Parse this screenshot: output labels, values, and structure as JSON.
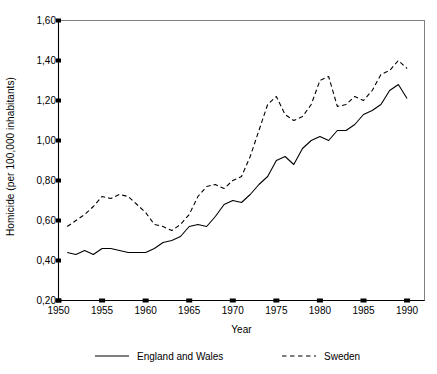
{
  "chart_data": {
    "type": "line",
    "title": "",
    "subtitle": "",
    "xlabel": "Year",
    "ylabel": "Homicide (per 100,000 inhabitants)",
    "xlim": [
      1950,
      1992
    ],
    "ylim": [
      0.2,
      1.6
    ],
    "grid": false,
    "legend_position": "bottom",
    "decimal_separator": ",",
    "xticks": [
      1950,
      1955,
      1960,
      1965,
      1970,
      1975,
      1980,
      1985,
      1990
    ],
    "xtick_labels": [
      "1950",
      "1955",
      "1960",
      "1965",
      "1970",
      "1975",
      "1980",
      "1985",
      "1990"
    ],
    "yticks": [
      0.2,
      0.4,
      0.6,
      0.8,
      1.0,
      1.2,
      1.4,
      1.6
    ],
    "ytick_labels": [
      "0,20",
      "0,40",
      "0,60",
      "0,80",
      "1,00",
      "1,20",
      "1,40",
      "1,60"
    ],
    "series": [
      {
        "name": "England and Wales",
        "style": "solid",
        "color": "#000000",
        "x": [
          1951,
          1952,
          1953,
          1954,
          1955,
          1956,
          1957,
          1958,
          1959,
          1960,
          1961,
          1962,
          1963,
          1964,
          1965,
          1966,
          1967,
          1968,
          1969,
          1970,
          1971,
          1972,
          1973,
          1974,
          1975,
          1976,
          1977,
          1978,
          1979,
          1980,
          1981,
          1982,
          1983,
          1984,
          1985,
          1986,
          1987,
          1988,
          1989,
          1990
        ],
        "values": [
          0.44,
          0.43,
          0.45,
          0.43,
          0.46,
          0.46,
          0.45,
          0.44,
          0.44,
          0.44,
          0.46,
          0.49,
          0.5,
          0.52,
          0.57,
          0.58,
          0.57,
          0.62,
          0.68,
          0.7,
          0.69,
          0.73,
          0.78,
          0.82,
          0.9,
          0.92,
          0.88,
          0.96,
          1.0,
          1.02,
          1.0,
          1.05,
          1.05,
          1.08,
          1.13,
          1.15,
          1.18,
          1.25,
          1.28,
          1.21
        ]
      },
      {
        "name": "Sweden",
        "style": "dashed",
        "color": "#000000",
        "x": [
          1951,
          1952,
          1953,
          1954,
          1955,
          1956,
          1957,
          1958,
          1959,
          1960,
          1961,
          1962,
          1963,
          1964,
          1965,
          1966,
          1967,
          1968,
          1969,
          1970,
          1971,
          1972,
          1973,
          1974,
          1975,
          1976,
          1977,
          1978,
          1979,
          1980,
          1981,
          1982,
          1983,
          1984,
          1985,
          1986,
          1987,
          1988,
          1989,
          1990
        ],
        "values": [
          0.57,
          0.6,
          0.63,
          0.67,
          0.72,
          0.71,
          0.73,
          0.72,
          0.68,
          0.64,
          0.58,
          0.57,
          0.55,
          0.58,
          0.63,
          0.72,
          0.77,
          0.78,
          0.76,
          0.8,
          0.82,
          0.92,
          1.05,
          1.18,
          1.22,
          1.13,
          1.1,
          1.12,
          1.18,
          1.3,
          1.32,
          1.17,
          1.18,
          1.22,
          1.2,
          1.25,
          1.33,
          1.35,
          1.4,
          1.36
        ]
      }
    ]
  },
  "axes": {
    "ylabel_text": "Homicide (per 100,000 inhabitants)",
    "xlabel_text": "Year"
  },
  "legend": {
    "items": [
      {
        "label": "England and Wales",
        "style": "solid"
      },
      {
        "label": "Sweden",
        "style": "dashed"
      }
    ]
  }
}
